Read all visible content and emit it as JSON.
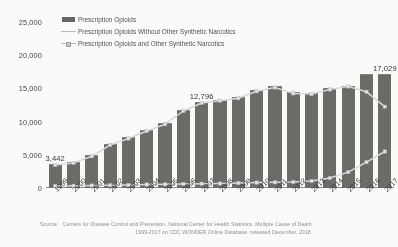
{
  "chart_data": {
    "type": "bar",
    "title": "",
    "xlabel": "",
    "ylabel": "",
    "ylim": [
      0,
      25000
    ],
    "ytick_step": 5000,
    "yticks": [
      "0",
      "5,000",
      "10,000",
      "15,000",
      "20,000",
      "25,000"
    ],
    "grid": false,
    "legend_position": "top-left",
    "categories": [
      "1999",
      "2000",
      "2001",
      "2002",
      "2003",
      "2004",
      "2005",
      "2006",
      "2007",
      "2008",
      "2009",
      "2010",
      "2011",
      "2012",
      "2013",
      "2014",
      "2015",
      "2016",
      "2017"
    ],
    "series": [
      {
        "name": "Prescription Opioids",
        "type": "bar",
        "color": "#666663",
        "values": [
          3442,
          3785,
          4770,
          6483,
          7460,
          8577,
          9612,
          11589,
          12796,
          13149,
          13523,
          14583,
          15140,
          14240,
          14145,
          14838,
          15281,
          17087,
          17029
        ]
      },
      {
        "name": "Prescription Opioids Without Other Synthetic Narcotics",
        "type": "line",
        "color": "#d9d9d9",
        "values": [
          3442,
          3785,
          4770,
          6483,
          7460,
          8577,
          9612,
          11589,
          12796,
          13149,
          13523,
          14583,
          15140,
          14240,
          14145,
          14838,
          15281,
          14487,
          12247
        ]
      },
      {
        "name": "Prescription Opioids and Other Synthetic Narcotics",
        "type": "line",
        "color": "#d9d9d9",
        "values": [
          730,
          782,
          957,
          1295,
          1400,
          1664,
          1742,
          2707,
          2213,
          2306,
          2946,
          3007,
          2666,
          2628,
          3105,
          5544,
          9580,
          19413,
          28466
        ],
        "plotted_values": [
          300,
          330,
          380,
          420,
          470,
          520,
          560,
          620,
          650,
          680,
          760,
          820,
          860,
          900,
          1050,
          1500,
          2400,
          3900,
          5500
        ]
      }
    ],
    "data_labels": [
      {
        "category": "1999",
        "value": "3,442"
      },
      {
        "category": "2007",
        "value": "12,796"
      },
      {
        "category": "2017",
        "value": "17,029"
      }
    ]
  },
  "legend": {
    "items": [
      {
        "label": "Prescription Opioids",
        "marker": "bar-swatch"
      },
      {
        "label": "Prescription Opioids Without Other Synthetic Narcotics",
        "marker": "line-swatch"
      },
      {
        "label": "Prescription Opioids and Other Synthetic Narcotics",
        "marker": "line-marker-swatch"
      }
    ]
  },
  "source": {
    "prefix": "Source:",
    "line1": "Centers for Disease Control and Prevention, National Center for Health Statistics. Multiple Cause of Death",
    "line2": "1999-2017 on CDC WONDER Online Database, released December, 2018"
  }
}
